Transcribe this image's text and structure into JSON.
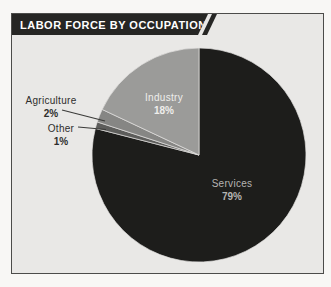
{
  "page": {
    "background": "#f8f7f5"
  },
  "card": {
    "background": "#e9e8e6",
    "border_color": "#4c4c4a"
  },
  "header": {
    "title": "LABOR FORCE BY OCCUPATION",
    "bar_color": "#262624",
    "text_color": "#ffffff"
  },
  "chart_data": {
    "type": "pie",
    "title": "LABOR FORCE BY OCCUPATION",
    "unit": "percent",
    "start_angle_deg": 0,
    "direction": "clockwise",
    "order_clockwise_from_top": [
      "Services",
      "Other",
      "Agriculture",
      "Industry"
    ],
    "slices": [
      {
        "label": "Services",
        "value": 79,
        "display": "79%",
        "color": "#1d1d1b",
        "label_placement": "inside",
        "label_color": "#b5b4b2"
      },
      {
        "label": "Other",
        "value": 1,
        "display": "1%",
        "color": "#5d5d5b",
        "label_placement": "outside-left",
        "label_color": "#2e2e2c"
      },
      {
        "label": "Agriculture",
        "value": 2,
        "display": "2%",
        "color": "#868684",
        "label_placement": "outside-left",
        "label_color": "#2e2e2c"
      },
      {
        "label": "Industry",
        "value": 18,
        "display": "18%",
        "color": "#9b9b99",
        "label_placement": "inside",
        "label_color": "#efeeec"
      }
    ],
    "separator_color": "#e2e1df",
    "leader_line_color": "#3a3a38",
    "legend": "none",
    "grid": "off"
  }
}
